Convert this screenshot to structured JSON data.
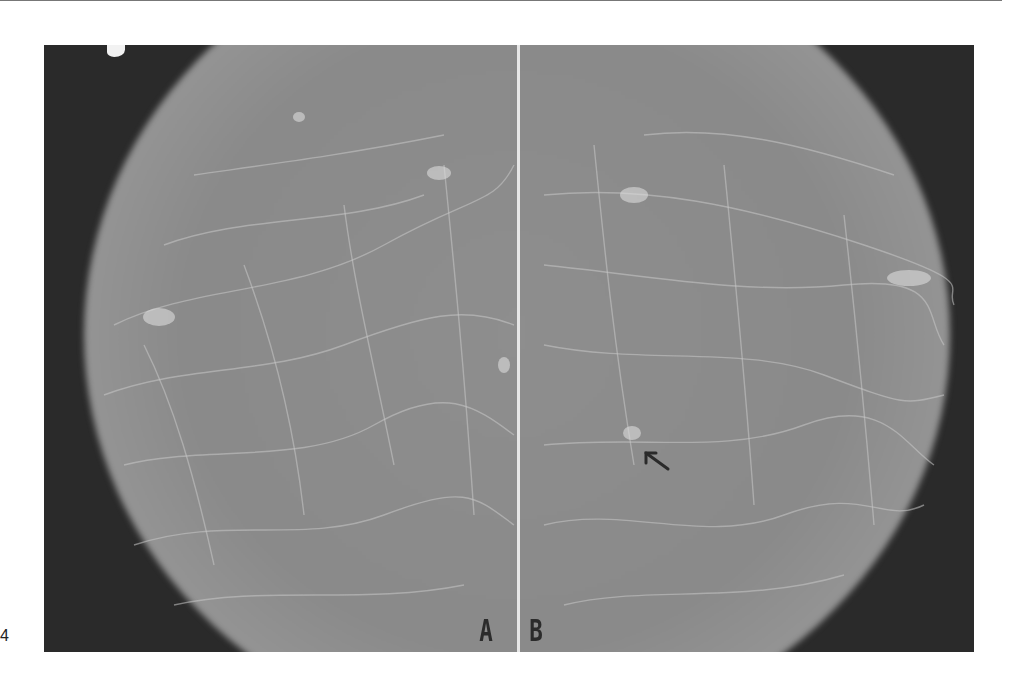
{
  "figure": {
    "number_label": "4",
    "panels": [
      {
        "id": "A",
        "label": "A"
      },
      {
        "id": "B",
        "label": "B"
      }
    ],
    "annotation": {
      "type": "arrow",
      "panel": "B",
      "points_to": "focal density"
    },
    "colors": {
      "background": "#2a2a2a",
      "tissue": "#8e8e8e",
      "divider": "#e6e6e6",
      "label": "#2b2b2b"
    }
  }
}
